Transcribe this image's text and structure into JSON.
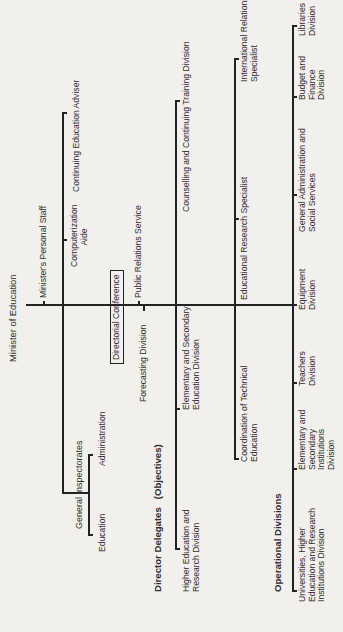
{
  "title": "Minister of Education",
  "top_staff": {
    "personal_staff": "Minister's Personal Staff",
    "computerization_aide": "Computerization\nAide",
    "continuing_education_adviser": "Continuing Education Adviser"
  },
  "general_inspectorates": {
    "label": "General Inspectorates",
    "education": "Education",
    "administration": "Administration"
  },
  "directorial_conference": "Directorial Conference",
  "forecasting_division": "Forecasting Division",
  "public_relations_service": "Public Relations Service",
  "director_delegates": {
    "label": "Director Delegates",
    "suffix": "(Objectives)",
    "items": [
      "Higher Education and Research Division",
      "Elementary and Secondary Education Division",
      "Counselling and Continuing Training Division"
    ]
  },
  "specialists": {
    "items": [
      "Coordination of Technical Education",
      "Educational Research Specialist",
      "International Relations Specialist"
    ]
  },
  "operational_divisions": {
    "label": "Operational Divisions",
    "items": [
      "Universities, Higher Education and Research Institutions Division",
      "Elementary and Secondary Institutions Division",
      "Teachers Division",
      "Equipment Division",
      "General Administration and Social Services",
      "Budget and Finance Division",
      "Libraries Division"
    ]
  }
}
